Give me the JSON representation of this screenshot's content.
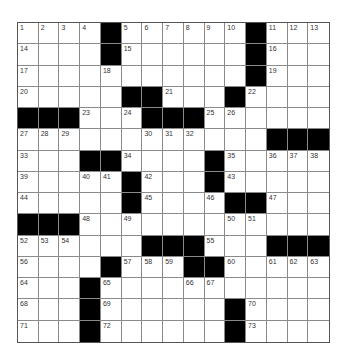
{
  "puzzle": {
    "size": {
      "rows": 15,
      "cols": 15
    },
    "colors": {
      "black": "#000000",
      "white": "#ffffff",
      "grid_line": "#8a8a8a"
    },
    "grid": [
      [
        "1",
        "2",
        "3",
        "4",
        "#",
        "5",
        "6",
        "7",
        "8",
        "9",
        "10",
        "#",
        "11",
        "12",
        "13"
      ],
      [
        "14",
        ".",
        ".",
        ".",
        "#",
        "15",
        ".",
        ".",
        ".",
        ".",
        ".",
        "#",
        "16",
        ".",
        "."
      ],
      [
        "17",
        ".",
        ".",
        ".",
        "18",
        ".",
        ".",
        ".",
        ".",
        ".",
        ".",
        "#",
        "19",
        ".",
        "."
      ],
      [
        "20",
        ".",
        ".",
        ".",
        ".",
        "#",
        "#",
        "21",
        ".",
        ".",
        "#",
        "22",
        ".",
        ".",
        "."
      ],
      [
        "#",
        "#",
        "#",
        "23",
        ".",
        "24",
        "#",
        "#",
        "#",
        "25",
        "26",
        ".",
        ".",
        ".",
        "."
      ],
      [
        "27",
        "28",
        "29",
        ".",
        ".",
        ".",
        "30",
        "31",
        "32",
        ".",
        ".",
        ".",
        "#",
        "#",
        "#"
      ],
      [
        "33",
        ".",
        ".",
        "#",
        "#",
        "34",
        ".",
        ".",
        ".",
        "#",
        "35",
        ".",
        "36",
        "37",
        "38"
      ],
      [
        "39",
        ".",
        ".",
        "40",
        "41",
        "#",
        "42",
        ".",
        ".",
        "#",
        "43",
        ".",
        ".",
        ".",
        "."
      ],
      [
        "44",
        ".",
        ".",
        ".",
        ".",
        "#",
        "45",
        ".",
        ".",
        "46",
        "#",
        "#",
        "47",
        ".",
        "."
      ],
      [
        "#",
        "#",
        "#",
        "48",
        ".",
        "49",
        ".",
        ".",
        ".",
        ".",
        "50",
        "51",
        ".",
        ".",
        "."
      ],
      [
        "52",
        "53",
        "54",
        ".",
        ".",
        ".",
        "#",
        "#",
        "#",
        "55",
        ".",
        ".",
        "#",
        "#",
        "#"
      ],
      [
        "56",
        ".",
        ".",
        ".",
        "#",
        "57",
        "58",
        "59",
        "#",
        "#",
        "60",
        ".",
        "61",
        "62",
        "63"
      ],
      [
        "64",
        ".",
        ".",
        "#",
        "65",
        ".",
        ".",
        ".",
        "66",
        "67",
        ".",
        ".",
        ".",
        ".",
        "."
      ],
      [
        "68",
        ".",
        ".",
        "#",
        "69",
        ".",
        ".",
        ".",
        ".",
        ".",
        "#",
        "70",
        ".",
        ".",
        "."
      ],
      [
        "71",
        ".",
        ".",
        "#",
        "72",
        ".",
        ".",
        ".",
        ".",
        ".",
        "#",
        "73",
        ".",
        ".",
        "."
      ]
    ]
  }
}
